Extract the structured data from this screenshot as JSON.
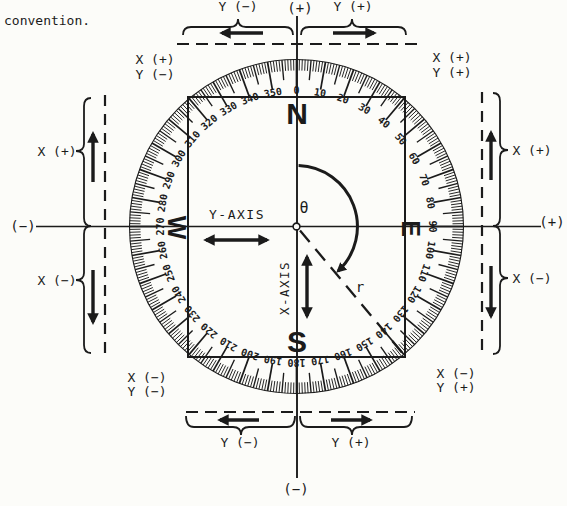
{
  "page": {
    "caption": "convention."
  },
  "colors": {
    "ink": "#1b1b1b",
    "paper": "#fcfcf9"
  },
  "dial": {
    "degree_labels": [
      "0",
      "10",
      "20",
      "30",
      "40",
      "50",
      "60",
      "70",
      "80",
      "90",
      "100",
      "110",
      "120",
      "130",
      "140",
      "150",
      "160",
      "170",
      "180",
      "190",
      "200",
      "210",
      "220",
      "230",
      "240",
      "250",
      "260",
      "270",
      "280",
      "290",
      "300",
      "310",
      "320",
      "330",
      "340",
      "350"
    ],
    "cardinals": {
      "north": "N",
      "east": "E",
      "south": "S",
      "west": "W"
    }
  },
  "center": {
    "theta_symbol": "θ",
    "radius_label": "r",
    "x_axis_label": "X-AXIS",
    "y_axis_label": "Y-AXIS"
  },
  "axis_ends": {
    "top": "(+)",
    "bottom": "(−)",
    "left": "(−)",
    "right": "(+)"
  },
  "sign_markers": {
    "top": {
      "left_label": "Y (−)",
      "right_label": "Y (+)"
    },
    "bottom": {
      "left_label": "Y (−)",
      "right_label": "Y (+)"
    },
    "left": {
      "upper_label": "X (+)",
      "lower_label": "X (−)"
    },
    "right": {
      "upper_label": "X (+)",
      "lower_label": "X (−)"
    }
  },
  "quadrant_signs": {
    "upper_left": {
      "x": "X (+)",
      "y": "Y (−)"
    },
    "upper_right": {
      "x": "X (+)",
      "y": "Y (+)"
    },
    "lower_left": {
      "x": "X (−)",
      "y": "Y (−)"
    },
    "lower_right": {
      "x": "X (−)",
      "y": "Y (+)"
    }
  }
}
